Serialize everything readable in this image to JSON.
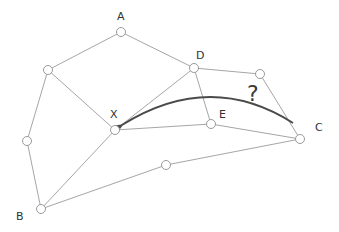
{
  "diagram": {
    "type": "graph",
    "colors": {
      "edge": "#a6a6a6",
      "node_stroke": "#9a9a9a",
      "arrow": "#4a4a4a",
      "text": "#333333"
    },
    "nodes": [
      {
        "id": "A",
        "label": "A",
        "x": 121,
        "y": 32,
        "lx": 117,
        "ly": 20
      },
      {
        "id": "n1",
        "label": "",
        "x": 48,
        "y": 70
      },
      {
        "id": "D",
        "label": "D",
        "x": 194,
        "y": 68,
        "lx": 196,
        "ly": 59
      },
      {
        "id": "n2",
        "label": "",
        "x": 260,
        "y": 74
      },
      {
        "id": "X",
        "label": "X",
        "x": 115,
        "y": 130,
        "lx": 110,
        "ly": 118
      },
      {
        "id": "E",
        "label": "E",
        "x": 211,
        "y": 124,
        "lx": 219,
        "ly": 118
      },
      {
        "id": "C",
        "label": "C",
        "x": 300,
        "y": 139,
        "lx": 315,
        "ly": 131
      },
      {
        "id": "n3",
        "label": "",
        "x": 27,
        "y": 141
      },
      {
        "id": "n4",
        "label": "",
        "x": 166,
        "y": 165
      },
      {
        "id": "B",
        "label": "B",
        "x": 41,
        "y": 209,
        "lx": 16,
        "ly": 220
      }
    ],
    "edges": [
      [
        "A",
        "n1"
      ],
      [
        "A",
        "D"
      ],
      [
        "n1",
        "X"
      ],
      [
        "n1",
        "n3"
      ],
      [
        "n3",
        "B"
      ],
      [
        "B",
        "X"
      ],
      [
        "B",
        "n4"
      ],
      [
        "n4",
        "C"
      ],
      [
        "X",
        "D"
      ],
      [
        "X",
        "E"
      ],
      [
        "E",
        "C"
      ],
      [
        "D",
        "E"
      ],
      [
        "D",
        "n2"
      ],
      [
        "n2",
        "C"
      ]
    ],
    "question": {
      "text": "?",
      "x": 247,
      "y": 101
    },
    "arrow": {
      "from": "C",
      "to": "X",
      "path": "M 293 123 Q 210 70 122 125"
    }
  }
}
